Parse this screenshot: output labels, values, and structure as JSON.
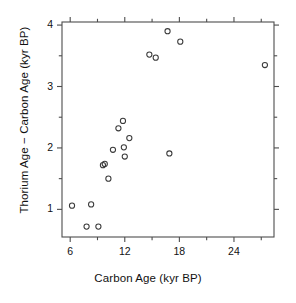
{
  "chart_data": {
    "type": "scatter",
    "title": "",
    "xlabel": "Carbon Age (kyr BP)",
    "ylabel": "Thorium Age − Carbon Age (kyr BP)",
    "xlim": [
      5.1,
      28.4
    ],
    "ylim": [
      0.55,
      4.05
    ],
    "xticks": [
      6,
      12,
      18,
      24
    ],
    "xtick_labels": [
      "6",
      "12",
      "18",
      "24"
    ],
    "xminor_ticks": [
      9,
      15,
      21,
      27
    ],
    "yticks": [
      1,
      2,
      3,
      4
    ],
    "ytick_labels": [
      "1",
      "2",
      "3",
      "4"
    ],
    "yminor_ticks": [
      1.5,
      2.5,
      3.5
    ],
    "grid": false,
    "legend": null,
    "marker": "open-circle",
    "marker_color": "#3a3a3a",
    "points": [
      {
        "x": 6.2,
        "y": 1.06
      },
      {
        "x": 7.8,
        "y": 0.72
      },
      {
        "x": 8.3,
        "y": 1.08
      },
      {
        "x": 9.1,
        "y": 0.72
      },
      {
        "x": 9.6,
        "y": 1.72
      },
      {
        "x": 9.8,
        "y": 1.74
      },
      {
        "x": 10.2,
        "y": 1.5
      },
      {
        "x": 10.7,
        "y": 1.97
      },
      {
        "x": 11.3,
        "y": 2.32
      },
      {
        "x": 11.8,
        "y": 2.44
      },
      {
        "x": 11.9,
        "y": 2.01
      },
      {
        "x": 12.0,
        "y": 1.86
      },
      {
        "x": 12.5,
        "y": 2.16
      },
      {
        "x": 14.7,
        "y": 3.52
      },
      {
        "x": 15.4,
        "y": 3.47
      },
      {
        "x": 16.7,
        "y": 3.9
      },
      {
        "x": 16.9,
        "y": 1.91
      },
      {
        "x": 18.1,
        "y": 3.73
      },
      {
        "x": 27.4,
        "y": 3.35
      }
    ]
  },
  "axes": {
    "frame_color": "#4d4d4d"
  }
}
